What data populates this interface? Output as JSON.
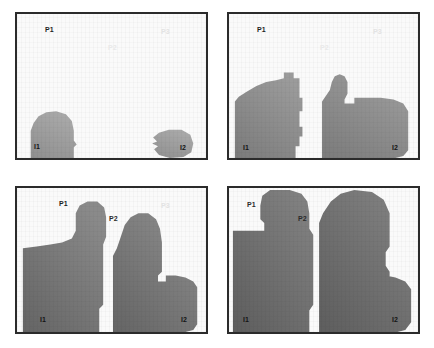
{
  "figure": {
    "title": "",
    "panel_count": 4,
    "background_color": "#fafafa",
    "frame_color": "#2b2b2b",
    "canvas_width": 434,
    "canvas_height": 348
  },
  "labels": {
    "p1": "P1",
    "p2": "P2",
    "p3": "P3",
    "i1": "I1",
    "i2": "I2"
  },
  "panels": [
    {
      "id": "panel-a",
      "index": 1,
      "position": "top-left",
      "caption": "",
      "region_fill": "#9e9e9e",
      "regions": [
        {
          "name": "region-i1",
          "label": "I1",
          "seed": "I1",
          "state": "seed"
        },
        {
          "name": "region-i2",
          "label": "I2",
          "seed": "I2",
          "state": "seed"
        }
      ],
      "markers": [
        {
          "name": "P1",
          "style": "dark"
        },
        {
          "name": "P2",
          "style": "faint"
        },
        {
          "name": "P3",
          "style": "faint"
        }
      ]
    },
    {
      "id": "panel-b",
      "index": 2,
      "position": "top-right",
      "caption": "",
      "region_fill": "#8a8a8a",
      "regions": [
        {
          "name": "region-i1",
          "label": "I1",
          "seed": "I1",
          "state": "grown"
        },
        {
          "name": "region-i2",
          "label": "I2",
          "seed": "I2",
          "state": "grown"
        }
      ],
      "markers": [
        {
          "name": "P1",
          "style": "dark"
        },
        {
          "name": "P2",
          "style": "faint"
        },
        {
          "name": "P3",
          "style": "faint"
        }
      ]
    },
    {
      "id": "panel-c",
      "index": 3,
      "position": "bottom-left",
      "caption": "",
      "region_fill": "#757575",
      "regions": [
        {
          "name": "region-i1",
          "label": "I1",
          "seed": "I1",
          "state": "grown"
        },
        {
          "name": "region-i2",
          "label": "I2",
          "seed": "I2",
          "state": "grown"
        }
      ],
      "markers": [
        {
          "name": "P1",
          "style": "dark"
        },
        {
          "name": "P2",
          "style": "on-blob"
        },
        {
          "name": "P3",
          "style": "faint"
        }
      ]
    },
    {
      "id": "panel-d",
      "index": 4,
      "position": "bottom-right",
      "caption": "",
      "region_fill": "#6e6e6e",
      "regions": [
        {
          "name": "region-i1",
          "label": "I1",
          "seed": "I1",
          "state": "merged"
        },
        {
          "name": "region-i2",
          "label": "I2",
          "seed": "I2",
          "state": "merged"
        }
      ],
      "markers": [
        {
          "name": "P1",
          "style": "on-blob"
        },
        {
          "name": "P2",
          "style": "on-blob"
        }
      ]
    }
  ]
}
